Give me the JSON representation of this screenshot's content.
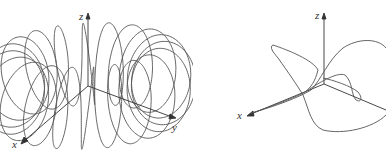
{
  "figures": [
    {
      "id": "toroidal-spiral",
      "axis_labels": {
        "x": "x",
        "y": "y",
        "z": "z"
      }
    },
    {
      "id": "twisted-curve",
      "axis_labels": {
        "x": "x",
        "z": "z"
      }
    }
  ],
  "colors": {
    "curve": "#555555",
    "axis": "#333333",
    "background": "#ffffff"
  }
}
